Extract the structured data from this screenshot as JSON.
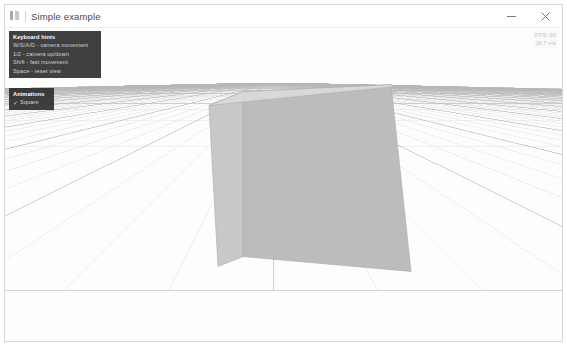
{
  "window": {
    "title": "Simple example",
    "icon": "app-icon",
    "controls": [
      {
        "name": "minimize",
        "label": "Minimize",
        "glyph": "minimize-icon"
      },
      {
        "name": "close",
        "label": "Close",
        "glyph": "close-icon"
      }
    ]
  },
  "hints_panel": {
    "title": "Keyboard hints",
    "rows": [
      "W/S/A/D - camera movement",
      "1/2 - camera up/down",
      "Shift - fast movement",
      "Space - reset view"
    ]
  },
  "animations_panel": {
    "title": "Animations",
    "checkbox": {
      "label": "Square",
      "checked": true,
      "mark": "✓"
    }
  },
  "stats": {
    "line1": "FPS: 60",
    "line2": "16.7 ms"
  },
  "scene": {
    "background_color": "#fdfdfd",
    "grid": {
      "minor_color": "#e2e2e2",
      "major_color": "#b6b6b6",
      "horizon_y_ratio": 0.175
    },
    "cube": {
      "top_face_color": "#d8d8d8",
      "left_face_color": "#c8c8c8",
      "right_face_color": "#bcbcbc",
      "edge_color": "#b0b0b0"
    }
  }
}
